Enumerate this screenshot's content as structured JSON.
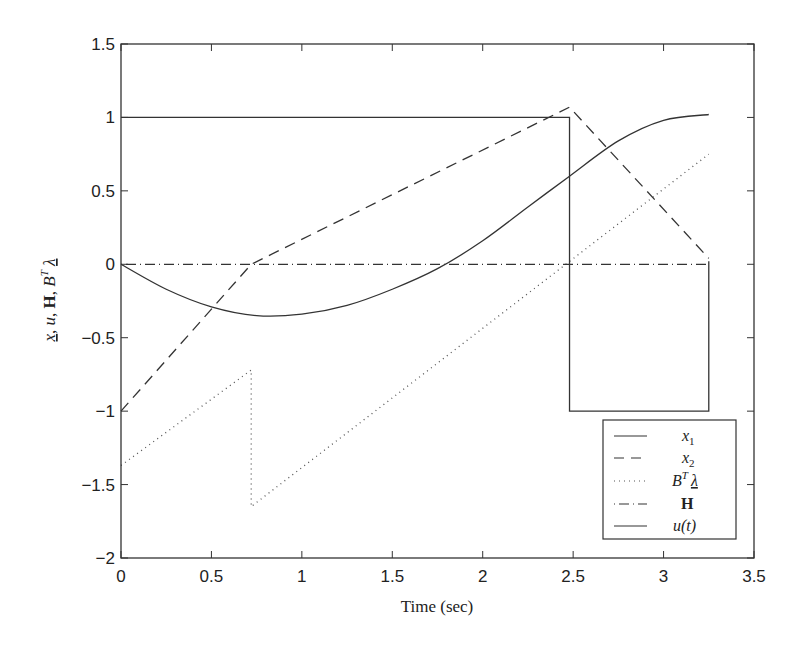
{
  "chart_data": {
    "type": "line",
    "title": "",
    "xlabel": "Time (sec)",
    "ylabel": "x, u, H, B^T λ",
    "xlim": [
      0,
      3.5
    ],
    "ylim": [
      -2,
      1.5
    ],
    "xticks": [
      0,
      0.5,
      1,
      1.5,
      2,
      2.5,
      3,
      3.5
    ],
    "yticks": [
      1.5,
      1,
      0.5,
      0,
      -0.5,
      -1,
      -1.5,
      -2
    ],
    "xtick_labels": [
      "0",
      "0.5",
      "1",
      "1.5",
      "2",
      "2.5",
      "3",
      "3.5"
    ],
    "ytick_labels": [
      "1.5",
      "1",
      "0.5",
      "0",
      "−0.5",
      "−1",
      "−1.5",
      "−2"
    ],
    "grid": false,
    "legend_position": "lower right",
    "series": [
      {
        "name": "x1",
        "style": "solid",
        "x": [
          0,
          0.25,
          0.5,
          0.75,
          1.0,
          1.25,
          1.5,
          1.75,
          2.0,
          2.25,
          2.48,
          2.75,
          3.0,
          3.25
        ],
        "y": [
          0,
          -0.17,
          -0.29,
          -0.35,
          -0.34,
          -0.28,
          -0.17,
          -0.03,
          0.16,
          0.39,
          0.6,
          0.84,
          0.98,
          1.02
        ]
      },
      {
        "name": "x2",
        "style": "dashed",
        "x": [
          0,
          0.72,
          2.48,
          3.25
        ],
        "y": [
          -1.0,
          0.0,
          1.07,
          0.04
        ]
      },
      {
        "name": "B^T λ",
        "style": "dotted",
        "x": [
          0,
          0.72,
          0.72,
          3.25
        ],
        "y": [
          -1.37,
          -0.72,
          -1.65,
          0.75
        ]
      },
      {
        "name": "H",
        "style": "dashdot",
        "x": [
          0,
          3.25
        ],
        "y": [
          0,
          0
        ]
      },
      {
        "name": "u(t)",
        "style": "solid",
        "x": [
          0,
          2.48,
          2.48,
          3.25,
          3.25
        ],
        "y": [
          1,
          1,
          -1,
          -1,
          0.02
        ]
      }
    ],
    "legend": [
      {
        "label": "x1",
        "style": "solid"
      },
      {
        "label": "x2",
        "style": "dashed"
      },
      {
        "label": "B^T λ",
        "style": "dotted"
      },
      {
        "label": "H",
        "style": "dashdot"
      },
      {
        "label": "u(t)",
        "style": "solid"
      }
    ]
  },
  "axis": {
    "xlabel": "Time (sec)",
    "ylabel_parts": [
      "x",
      ", ",
      "u",
      ", ",
      "H",
      ", ",
      "B",
      "T",
      " ",
      "λ"
    ]
  },
  "legend_labels": {
    "x1_main": "x",
    "x1_sub": "1",
    "x2_main": "x",
    "x2_sub": "2",
    "bl_main": "B",
    "bl_sup": "T",
    "bl_lambda": "λ",
    "h": "H",
    "u": "u(t)"
  }
}
